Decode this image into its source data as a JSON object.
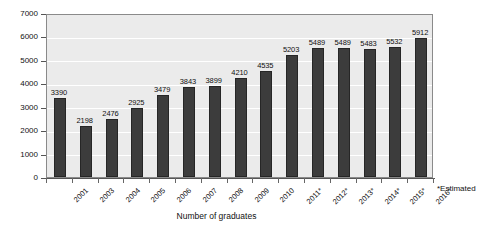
{
  "chart_data": {
    "type": "bar",
    "title": "",
    "subtitle": "",
    "xlabel": "Number of graduates",
    "ylabel": "",
    "ylim": [
      0,
      7000
    ],
    "ytick_step": 1000,
    "yticks": [
      0,
      1000,
      2000,
      3000,
      4000,
      5000,
      6000,
      7000
    ],
    "ytick_labels": [
      "0",
      "1000",
      "2000",
      "3000",
      "4000",
      "5000",
      "6000",
      "7000"
    ],
    "grid": true,
    "grid_axis": "y",
    "legend": false,
    "legend_position": "none",
    "categories": [
      "2001",
      "2003",
      "2004",
      "2005",
      "2006",
      "2007",
      "2008",
      "2009",
      "2010",
      "2011*",
      "2012*",
      "2013*",
      "2014*",
      "2015*",
      "2016*"
    ],
    "values": [
      3390,
      2198,
      2476,
      2925,
      3479,
      3843,
      3899,
      4210,
      4535,
      5203,
      5489,
      5489,
      5483,
      5532,
      5912
    ],
    "data_labels": [
      "3390",
      "2198",
      "2476",
      "2925",
      "3479",
      "3843",
      "3899",
      "4210",
      "4535",
      "5203",
      "5489",
      "5489",
      "5483",
      "5532",
      "5912"
    ],
    "annotations": [
      "*Estimated"
    ],
    "colors": {
      "bar": "#3c3c3c",
      "bar_border": "#262626",
      "plot_background": "#ebebeb",
      "gridline": "#ffffff",
      "axis": "#555555",
      "frame_border": "#8a8a8a",
      "text": "#111111",
      "page_background": "#ffffff"
    }
  },
  "footnote": {
    "text": "*Estimated"
  }
}
